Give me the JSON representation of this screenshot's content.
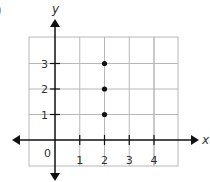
{
  "partial_label": ")",
  "chart_data": {
    "type": "scatter",
    "title": "",
    "xlabel": "x",
    "ylabel": "y",
    "x_ticks": [
      "0",
      "1",
      "2",
      "3",
      "4"
    ],
    "y_ticks": [
      "1",
      "2",
      "3"
    ],
    "xlim": [
      -1,
      5
    ],
    "ylim": [
      -1,
      4
    ],
    "grid": true,
    "series": [
      {
        "name": "points",
        "x": [
          2,
          2,
          2
        ],
        "y": [
          1,
          2,
          3
        ]
      }
    ],
    "points": [
      {
        "x": 2,
        "y": 1
      },
      {
        "x": 2,
        "y": 2
      },
      {
        "x": 2,
        "y": 3
      }
    ],
    "colors": {
      "axis": "#111111",
      "grid": "#b8b8b8",
      "point": "#111111",
      "text": "#333333"
    }
  }
}
